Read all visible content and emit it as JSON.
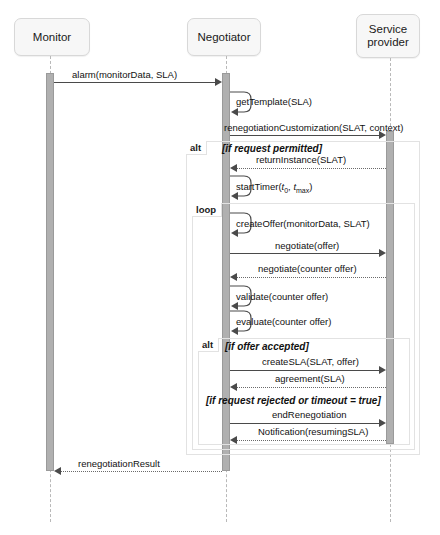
{
  "diagram": {
    "type": "uml-sequence-diagram",
    "colors": {
      "lifeline_head_fill": "#f7f7f7",
      "lifeline_head_border": "#d8d8d8",
      "activation_fill": "#b0b0b0",
      "fragment_border": "#e2e2e2",
      "message_line": "#4a4a4a",
      "background": "#ffffff"
    }
  },
  "lifelines": [
    {
      "id": "monitor",
      "label": "Monitor"
    },
    {
      "id": "negotiator",
      "label": "Negotiator"
    },
    {
      "id": "service_provider",
      "label": "Service\nprovider"
    }
  ],
  "lifeline_labels": {
    "monitor": "Monitor",
    "negotiator": "Negotiator",
    "service_provider_line1": "Service",
    "service_provider_line2": "provider"
  },
  "fragments": [
    {
      "id": "alt-outer",
      "operator": "alt",
      "guards": [
        "[if request permitted]",
        "[if request rejected or timeout = true]"
      ]
    },
    {
      "id": "loop",
      "operator": "loop",
      "guards": []
    },
    {
      "id": "alt-inner",
      "operator": "alt",
      "guards": [
        "[if offer accepted]"
      ]
    }
  ],
  "fragment_labels": {
    "alt_outer": "alt",
    "loop": "loop",
    "alt_inner": "alt"
  },
  "guards": {
    "if_request_permitted": "[if request permitted]",
    "if_offer_accepted": "[if offer accepted]",
    "if_request_rejected": "[if request rejected or timeout = true]"
  },
  "messages": [
    {
      "id": "m1",
      "label": "alarm(monitorData, SLA)",
      "from": "monitor",
      "to": "negotiator",
      "kind": "sync"
    },
    {
      "id": "m2",
      "label": "getTemplate(SLA)",
      "from": "negotiator",
      "to": "negotiator",
      "kind": "self"
    },
    {
      "id": "m3",
      "label": "renegotiationCustomization(SLAT, context)",
      "from": "negotiator",
      "to": "service_provider",
      "kind": "sync"
    },
    {
      "id": "m4",
      "label": "returnInstance(SLAT)",
      "from": "service_provider",
      "to": "negotiator",
      "kind": "return"
    },
    {
      "id": "m5",
      "label": "startTimer(t0, tmax)",
      "from": "negotiator",
      "to": "negotiator",
      "kind": "self"
    },
    {
      "id": "m6",
      "label": "createOffer(monitorData, SLAT)",
      "from": "negotiator",
      "to": "negotiator",
      "kind": "self"
    },
    {
      "id": "m7",
      "label": "negotiate(offer)",
      "from": "negotiator",
      "to": "service_provider",
      "kind": "sync"
    },
    {
      "id": "m8",
      "label": "negotiate(counter offer)",
      "from": "service_provider",
      "to": "negotiator",
      "kind": "return"
    },
    {
      "id": "m9",
      "label": "validate(counter offer)",
      "from": "negotiator",
      "to": "negotiator",
      "kind": "self"
    },
    {
      "id": "m10",
      "label": "evaluate(counter offer)",
      "from": "negotiator",
      "to": "negotiator",
      "kind": "self"
    },
    {
      "id": "m11",
      "label": "createSLA(SLAT, offer)",
      "from": "negotiator",
      "to": "service_provider",
      "kind": "sync"
    },
    {
      "id": "m12",
      "label": "agreement(SLA)",
      "from": "service_provider",
      "to": "negotiator",
      "kind": "return"
    },
    {
      "id": "m13",
      "label": "endRenegotiation",
      "from": "negotiator",
      "to": "service_provider",
      "kind": "sync"
    },
    {
      "id": "m14",
      "label": "Notification(resumingSLA)",
      "from": "service_provider",
      "to": "negotiator",
      "kind": "return"
    },
    {
      "id": "m15",
      "label": "renegotiationResult",
      "from": "negotiator",
      "to": "monitor",
      "kind": "return"
    }
  ],
  "message_labels": {
    "alarm": "alarm(monitorData, SLA)",
    "get_template": "getTemplate(SLA)",
    "renegotiation_customization": "renegotiationCustomization(SLAT, context)",
    "return_instance": "returnInstance(SLAT)",
    "start_timer_prefix": "startTimer(",
    "start_timer_t": "t",
    "start_timer_sub0": "0",
    "start_timer_mid": ", ",
    "start_timer_t2": "t",
    "start_timer_submax": "max",
    "start_timer_suffix": ")",
    "create_offer": "createOffer(monitorData, SLAT)",
    "negotiate_offer": "negotiate(offer)",
    "negotiate_counter_offer": "negotiate(counter offer)",
    "validate_counter_offer": "validate(counter offer)",
    "evaluate_counter_offer": "evaluate(counter offer)",
    "create_sla": "createSLA(SLAT, offer)",
    "agreement": "agreement(SLA)",
    "end_renegotiation": "endRenegotiation",
    "notification": "Notification(resumingSLA)",
    "renegotiation_result": "renegotiationResult"
  }
}
